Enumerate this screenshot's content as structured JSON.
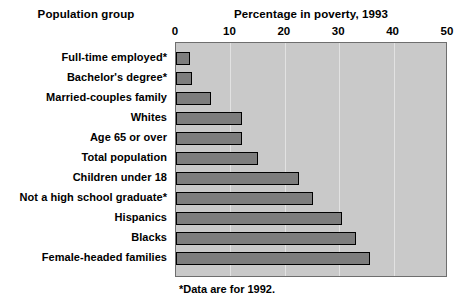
{
  "headings": {
    "group": "Population group",
    "value": "Percentage in poverty, 1993"
  },
  "footnote": "*Data are for 1992.",
  "colors": {
    "plot_background": "#c9c9c9",
    "bar_fill": "#7d7d7d",
    "bar_border": "#000000",
    "gridline": "#e2e2e2",
    "text": "#000000",
    "page_background": "#ffffff"
  },
  "chart_data": {
    "type": "bar",
    "orientation": "horizontal",
    "title": "Percentage in poverty, 1993",
    "xlabel": "Percentage in poverty, 1993",
    "ylabel": "Population group",
    "xlim": [
      0,
      50
    ],
    "ticks": [
      0,
      10,
      20,
      30,
      40,
      50
    ],
    "tick_labels": [
      "0",
      "10",
      "20",
      "30",
      "40",
      "50"
    ],
    "grid": true,
    "legend": "none",
    "annotations": [
      "*Data are for 1992."
    ],
    "categories": [
      "Full-time employed*",
      "Bachelor's degree*",
      "Married-couples family",
      "Whites",
      "Age 65 or over",
      "Total population",
      "Children under 18",
      "Not a high school graduate*",
      "Hispanics",
      "Blacks",
      "Female-headed families"
    ],
    "values": [
      2.5,
      3.0,
      6.5,
      12.2,
      12.2,
      15.1,
      22.7,
      25.1,
      30.6,
      33.1,
      35.6
    ],
    "series": [
      {
        "name": "Percentage in poverty",
        "values": [
          2.5,
          3.0,
          6.5,
          12.2,
          12.2,
          15.1,
          22.7,
          25.1,
          30.6,
          33.1,
          35.6
        ]
      }
    ]
  }
}
